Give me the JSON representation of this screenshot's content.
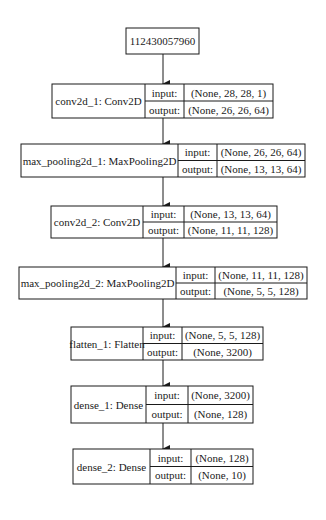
{
  "diagram": {
    "type": "keras-model-plot",
    "input_node": {
      "label": "112430057960"
    },
    "row_keys": {
      "input": "input:",
      "output": "output:"
    },
    "layers": [
      {
        "name": "conv2d_1: Conv2D",
        "input": "(None, 28, 28, 1)",
        "output": "(None, 26, 26, 64)"
      },
      {
        "name": "max_pooling2d_1: MaxPooling2D",
        "input": "(None, 26, 26, 64)",
        "output": "(None, 13, 13, 64)"
      },
      {
        "name": "conv2d_2: Conv2D",
        "input": "(None, 13, 13, 64)",
        "output": "(None, 11, 11, 128)"
      },
      {
        "name": "max_pooling2d_2: MaxPooling2D",
        "input": "(None, 11, 11, 128)",
        "output": "(None, 5, 5, 128)"
      },
      {
        "name": "flatten_1: Flatten",
        "input": "(None, 5, 5, 128)",
        "output": "(None, 3200)"
      },
      {
        "name": "dense_1: Dense",
        "input": "(None, 3200)",
        "output": "(None, 128)"
      },
      {
        "name": "dense_2: Dense",
        "input": "(None, 128)",
        "output": "(None, 10)"
      }
    ],
    "edges": [
      [
        "112430057960",
        "conv2d_1"
      ],
      [
        "conv2d_1",
        "max_pooling2d_1"
      ],
      [
        "max_pooling2d_1",
        "conv2d_2"
      ],
      [
        "conv2d_2",
        "max_pooling2d_2"
      ],
      [
        "max_pooling2d_2",
        "flatten_1"
      ],
      [
        "flatten_1",
        "dense_1"
      ],
      [
        "dense_1",
        "dense_2"
      ]
    ]
  }
}
